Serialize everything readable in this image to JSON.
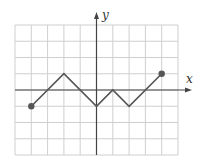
{
  "chart_data": {
    "type": "line",
    "title": "",
    "xlabel": "x",
    "ylabel": "y",
    "xlim": [
      -5,
      5
    ],
    "ylim": [
      -4,
      4
    ],
    "grid": true,
    "grid_step": 1,
    "tick_labels": false,
    "series": [
      {
        "name": "piecewise-linear graph",
        "x": [
          -4,
          -2,
          0,
          1,
          2,
          4
        ],
        "y": [
          -1,
          1,
          -1,
          0,
          -1,
          1
        ],
        "endpoints": "closed-dots"
      }
    ]
  },
  "labels": {
    "x_axis": "x",
    "y_axis": "y"
  },
  "colors": {
    "grid": "#cfcfcf",
    "axis": "#444444",
    "line": "#555555",
    "dot": "#555555"
  }
}
